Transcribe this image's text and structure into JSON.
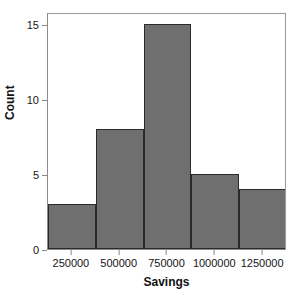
{
  "chart_data": {
    "type": "bar",
    "title": "",
    "subtitle": "",
    "xlabel": "Savings",
    "ylabel": "Count",
    "categories": [
      "250000",
      "500000",
      "750000",
      "1000000",
      "1250000"
    ],
    "values": [
      3,
      8,
      15,
      5,
      4
    ],
    "x_tick_labels": [
      "250000",
      "500000",
      "750000",
      "1000000",
      "1250000"
    ],
    "y_tick_labels": [
      "0",
      "5",
      "10",
      "15"
    ],
    "y_ticks": [
      0,
      5,
      10,
      15
    ],
    "ylim": [
      0,
      15.8
    ],
    "xlim": [
      125000,
      1375000
    ],
    "bin_width": 250000,
    "grid": false,
    "legend": false,
    "bar_fill_color": "#6f6f6f",
    "bar_border_color": "#2a2a2a",
    "axis_color": "#8a8a8a",
    "background_color": "#ffffff",
    "bars": [
      {
        "label": "250000",
        "value": 3
      },
      {
        "label": "500000",
        "value": 8
      },
      {
        "label": "750000",
        "value": 15
      },
      {
        "label": "1000000",
        "value": 5
      },
      {
        "label": "1250000",
        "value": 4
      }
    ],
    "total_count": 35
  }
}
